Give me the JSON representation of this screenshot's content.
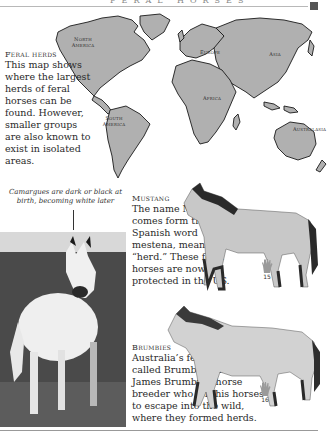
{
  "page": {
    "header": "FERAL HORSES",
    "accent_color": "#555555"
  },
  "map": {
    "labels": {
      "north_america": "North America",
      "europe": "Europe",
      "asia": "Asia",
      "africa": "Africa",
      "south_america": "South America",
      "australasia": "Australasia"
    },
    "land_color": "#b0b0b0",
    "outline_color": "#1a1a1a"
  },
  "feral_herds": {
    "title": "Feral herds",
    "body": "This map shows where the largest herds of feral horses can be found. However, smaller groups are also known to exist in isolated areas."
  },
  "camargue": {
    "caption": "Camargues are dark or black at birth, becoming white later"
  },
  "mustang": {
    "title": "Mustang",
    "body": "The name Mustang comes form the Spanish word mestena, meaning “herd.” These feral horses are now protected in the US.",
    "height_hands": "15"
  },
  "brumbies": {
    "title": "Brumbies",
    "body": "Australia’s feral horses are called Brumbies, after James Brumby, a horse breeder who left his horses to escape into the wild, where they formed herds.",
    "height_hands": "16"
  }
}
